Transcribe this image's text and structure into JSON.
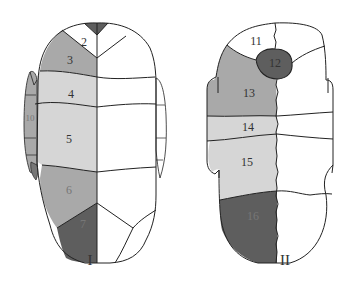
{
  "figures": [
    {
      "caption": "I",
      "regions": [
        {
          "id": "1",
          "label": "",
          "shade": "dark"
        },
        {
          "id": "2",
          "label": "2",
          "shade": "white"
        },
        {
          "id": "3",
          "label": "3",
          "shade": "medium"
        },
        {
          "id": "4",
          "label": "4",
          "shade": "light"
        },
        {
          "id": "5",
          "label": "5",
          "shade": "light"
        },
        {
          "id": "6",
          "label": "6",
          "shade": "medium"
        },
        {
          "id": "7",
          "label": "7",
          "shade": "dark"
        },
        {
          "id": "9",
          "label": "9",
          "shade": "medium"
        },
        {
          "id": "10",
          "label": "10",
          "shade": "medium"
        }
      ]
    },
    {
      "caption": "II",
      "regions": [
        {
          "id": "11",
          "label": "11",
          "shade": "white"
        },
        {
          "id": "12",
          "label": "12",
          "shade": "dark"
        },
        {
          "id": "13",
          "label": "13",
          "shade": "medium"
        },
        {
          "id": "14",
          "label": "14",
          "shade": "light"
        },
        {
          "id": "15",
          "label": "15",
          "shade": "light"
        },
        {
          "id": "16",
          "label": "16",
          "shade": "dark"
        }
      ]
    }
  ],
  "colors": {
    "dark": "#5e5e5e",
    "medium": "#a9a9a9",
    "light": "#d6d6d6",
    "white": "#ffffff",
    "outline": "#222222"
  }
}
